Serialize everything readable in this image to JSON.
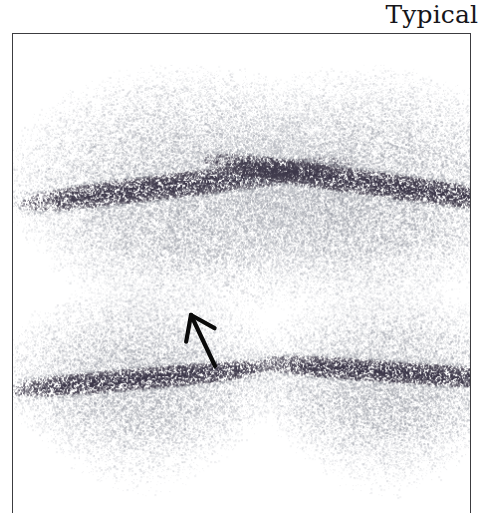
{
  "figure": {
    "title": "Typical",
    "title_align": "right",
    "panel_border_color": "#3c3c40",
    "background_color": "#ffffff"
  },
  "scan": {
    "modality_label": "scintigraphy-speckle",
    "view_count": 4,
    "speckle_light_color": "#b9bcc4",
    "speckle_mid_color": "#8a8d96",
    "speckle_dark_color": "#4a4554",
    "band_dark_color": "#3a3548",
    "views": [
      {
        "name": "upper-left-view",
        "cx": 175,
        "cy": 170,
        "rx": 178,
        "ry": 128,
        "band_y": 150,
        "band_tilt": -7,
        "band_thickness": 30,
        "has_defect": true
      },
      {
        "name": "upper-right-view",
        "cx": 350,
        "cy": 168,
        "rx": 170,
        "ry": 125,
        "band_y": 148,
        "band_tilt": 8,
        "band_thickness": 30,
        "has_defect": false
      },
      {
        "name": "lower-left-view",
        "cx": 130,
        "cy": 355,
        "rx": 140,
        "ry": 98,
        "band_y": 345,
        "band_tilt": -5,
        "band_thickness": 26,
        "has_defect": false
      },
      {
        "name": "lower-right-view",
        "cx": 375,
        "cy": 358,
        "rx": 135,
        "ry": 98,
        "band_y": 338,
        "band_tilt": 4,
        "band_thickness": 26,
        "has_defect": false
      }
    ]
  },
  "annotation": {
    "type": "arrow",
    "direction": "up-left",
    "color": "#0a0a0a",
    "tail_x": 202,
    "tail_y": 332,
    "tip_x": 178,
    "tip_y": 281,
    "target_view": "upper-left-view",
    "label": ""
  }
}
